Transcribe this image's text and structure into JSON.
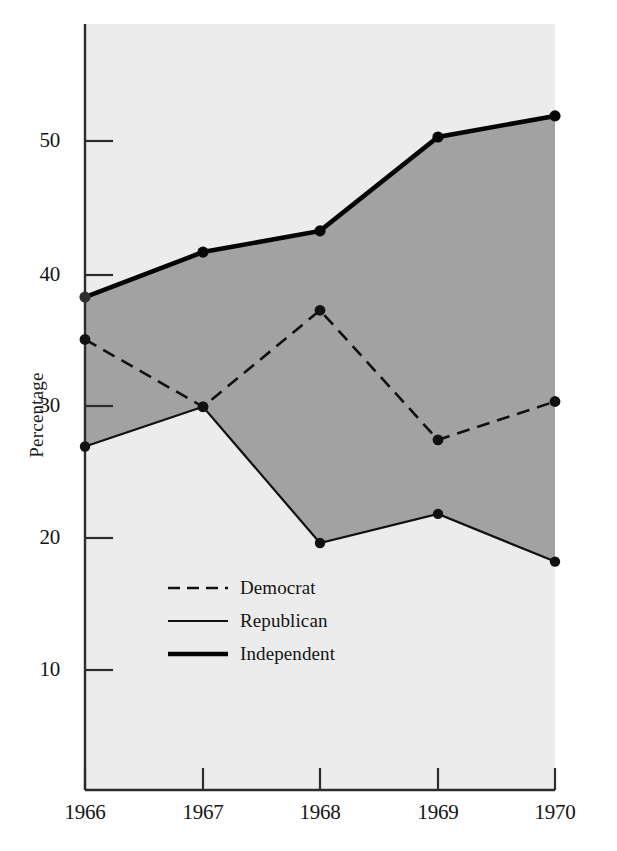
{
  "chart_data": {
    "type": "line",
    "title": "",
    "subtitle": "",
    "xlabel": "",
    "ylabel": "Percentage",
    "categories": [
      "1966",
      "1967",
      "1968",
      "1969",
      "1970"
    ],
    "x_tick_labels": [
      "1966",
      "1967",
      "1968",
      "1969",
      "1970"
    ],
    "y_tick_labels": [
      "10",
      "20",
      "30",
      "40",
      "50"
    ],
    "y_tick_values": [
      10,
      20,
      30,
      40,
      50
    ],
    "ylim": [
      2.5,
      60.5
    ],
    "xlim": [
      "1966",
      "1970"
    ],
    "grid": false,
    "legend_position": "inside-lower-left",
    "shaded_band": {
      "between": [
        "Independent",
        "Republican"
      ],
      "fill_color": "#a2a2a2",
      "description": "Gray band spanning from the Republican line up to the Independent line"
    },
    "plot_background": "#ececec",
    "series": [
      {
        "name": "Democrat",
        "style": "dashed",
        "color": "#111111",
        "values": [
          35.0,
          29.9,
          37.2,
          27.4,
          30.3
        ]
      },
      {
        "name": "Republican",
        "style": "solid-thin",
        "color": "#111111",
        "values": [
          26.9,
          29.9,
          19.6,
          21.8,
          18.2
        ]
      },
      {
        "name": "Independent",
        "style": "solid-thick",
        "color": "#050505",
        "values": [
          38.2,
          41.6,
          43.2,
          50.3,
          51.9
        ]
      }
    ]
  },
  "legend": {
    "items": [
      {
        "label": "Democrat",
        "swatch": "dashed-line-swatch"
      },
      {
        "label": "Republican",
        "swatch": "thin-line-swatch"
      },
      {
        "label": "Independent",
        "swatch": "thick-line-swatch"
      }
    ]
  },
  "axes": {
    "y_axis_title": "Percentage"
  }
}
